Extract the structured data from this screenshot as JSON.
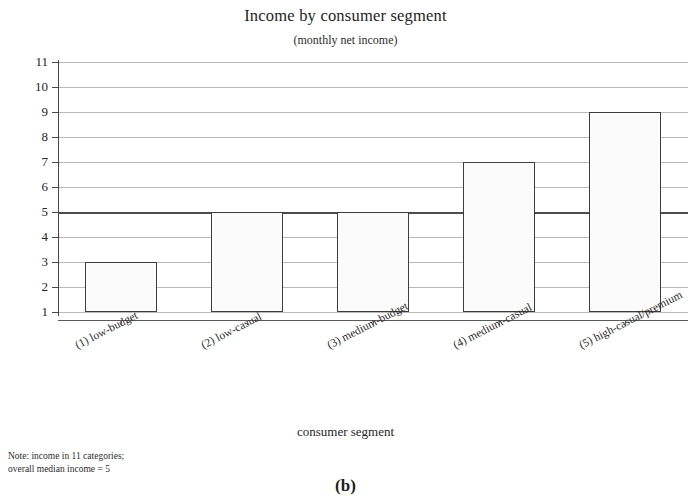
{
  "chart_data": {
    "type": "bar",
    "title": "Income by consumer segment",
    "subtitle": "(monthly net income)",
    "xlabel": "consumer segment",
    "ylabel": "",
    "categories": [
      "(1) low-budget",
      "(2) low-casual",
      "(3) medium-budget",
      "(4) medium-casual",
      "(5) high-casual/premium"
    ],
    "values": [
      3,
      5,
      5,
      7,
      9
    ],
    "baseline": 1,
    "ylim": [
      1,
      11
    ],
    "yticks": [
      1,
      2,
      3,
      4,
      5,
      6,
      7,
      8,
      9,
      10,
      11
    ],
    "ytick_labels": [
      "1",
      "2",
      "3",
      "4",
      "5",
      "6",
      "7",
      "8",
      "9",
      "10",
      "11"
    ],
    "grid": true,
    "legend": "none",
    "reference_line": {
      "value": 5,
      "label": "overall median income = 5",
      "emphasis": "bold"
    },
    "colors": {
      "bar_fill": "#fbfbfb",
      "bar_edge": "#3d3d3d",
      "gridline": "#b9b9b9",
      "median_line": "#4c4c4c",
      "axis": "#4a4a4a",
      "text": "#2b2b2b",
      "background": "#ffffff"
    }
  },
  "note": {
    "line1": "Note: income in 11 categories;",
    "line2": "overall median income = 5",
    "text": "Note: income in 11 categories;\noverall median income = 5"
  },
  "caption": {
    "label": "(b)"
  }
}
